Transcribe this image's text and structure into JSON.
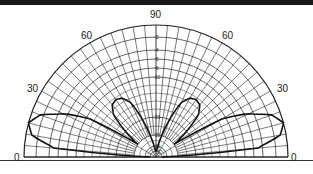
{
  "chart_data": {
    "type": "polar",
    "title": "",
    "angle_labels": [
      {
        "label": "0",
        "angle": 180
      },
      {
        "label": "30",
        "angle": 150
      },
      {
        "label": "60",
        "angle": 120
      },
      {
        "label": "90",
        "angle": 90
      },
      {
        "label": "60",
        "angle": 60
      },
      {
        "label": "30",
        "angle": 30
      },
      {
        "label": "0",
        "angle": 0
      }
    ],
    "radial_rings_db": [
      0,
      -2,
      -4,
      -6,
      -8,
      -10,
      -20,
      -30,
      -40,
      -50
    ],
    "radial_tick_labels": [
      "-2",
      "-4",
      "-6",
      "-8",
      "-10",
      "-20",
      "-30",
      "-40",
      "-50"
    ],
    "angular_grid_step_deg": 5,
    "series": [
      {
        "name": "elevation pattern",
        "elevation_deg": [
          0,
          5,
          10,
          15,
          20,
          25,
          30,
          35,
          40,
          45,
          50,
          55,
          60,
          65,
          70,
          75,
          80,
          85,
          90
        ],
        "relative_db": [
          -50,
          -5,
          -1,
          0,
          -1.5,
          -5,
          -11,
          -30,
          -20,
          -15,
          -13,
          -12.5,
          -13,
          -15,
          -20,
          -30,
          -40,
          -50,
          -50
        ]
      }
    ],
    "grid": true,
    "legend": null
  },
  "labels": {
    "a0l": "0",
    "a30l": "30",
    "a60l": "60",
    "a90": "90",
    "a60r": "60",
    "a30r": "30",
    "a0r": "0",
    "r2": "-2",
    "r4": "-4",
    "r6": "-6",
    "r8": "-8",
    "r10": "-10",
    "r20": "-20",
    "r30": "-30",
    "r40": "-40",
    "r50": "-50"
  }
}
